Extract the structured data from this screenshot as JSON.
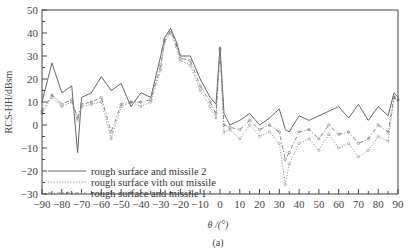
{
  "chart_data": {
    "type": "line",
    "title": "",
    "caption": "(a)",
    "xlabel": "θ /(°)",
    "ylabel": "RCS-HH/dBsm",
    "xlim": [
      -90,
      90
    ],
    "ylim": [
      -30,
      50
    ],
    "xticks": [
      -90,
      -80,
      -70,
      -60,
      -50,
      -40,
      -30,
      -20,
      -10,
      0,
      10,
      20,
      30,
      40,
      50,
      60,
      70,
      80,
      90
    ],
    "xtick_labels": [
      "−90",
      "−80",
      "−70",
      "−60",
      "−50",
      "−40",
      "−30",
      "−20",
      "−10",
      "0",
      "10",
      "20",
      "30",
      "40",
      "50",
      "60",
      "70",
      "80",
      "90"
    ],
    "yticks": [
      -30,
      -20,
      -10,
      0,
      10,
      20,
      30,
      40,
      50
    ],
    "ytick_labels": [
      "−30",
      "−20",
      "−10",
      "0",
      "10",
      "20",
      "30",
      "40",
      "50"
    ],
    "grid": false,
    "legend_position": "lower left",
    "x": [
      -90,
      -85,
      -80,
      -75,
      -72,
      -70,
      -65,
      -60,
      -55,
      -50,
      -45,
      -40,
      -35,
      -30,
      -28,
      -25,
      -22,
      -20,
      -15,
      -10,
      -5,
      -2,
      0,
      2,
      5,
      10,
      15,
      20,
      25,
      30,
      33,
      35,
      40,
      45,
      50,
      55,
      60,
      65,
      70,
      75,
      80,
      85,
      88,
      90
    ],
    "series": [
      {
        "name": "rough surface and missile 2",
        "style": "solid",
        "color": "#555555",
        "values": [
          10,
          27,
          14,
          17,
          -12,
          12,
          14,
          21,
          15,
          18,
          8,
          14,
          12,
          30,
          38,
          42,
          36,
          30,
          30,
          20,
          12,
          9,
          34,
          5,
          0,
          2,
          5,
          0,
          3,
          7,
          -2,
          -3,
          4,
          2,
          4,
          6,
          8,
          3,
          9,
          2,
          8,
          4,
          14,
          12
        ]
      },
      {
        "name": "rough surface vith out missile",
        "style": "dotted",
        "color": "#999999",
        "values": [
          5,
          12,
          8,
          10,
          2,
          8,
          9,
          10,
          -6,
          8,
          10,
          8,
          10,
          24,
          36,
          40,
          34,
          28,
          26,
          15,
          8,
          3,
          32,
          -3,
          -2,
          -6,
          0,
          -5,
          -3,
          -8,
          -26,
          -17,
          -8,
          -6,
          -11,
          -4,
          -10,
          -8,
          -14,
          -11,
          -5,
          -7,
          12,
          11
        ]
      },
      {
        "name": "rough surface and missile 1",
        "style": "dash-dot-marker",
        "color": "#777777",
        "values": [
          6,
          13,
          9,
          11,
          3,
          9,
          10,
          12,
          -3,
          9,
          10,
          10,
          11,
          26,
          37,
          41,
          35,
          29,
          28,
          17,
          10,
          5,
          33,
          0,
          -1,
          -2,
          2,
          -2,
          0,
          -3,
          -15,
          -12,
          -3,
          -2,
          -6,
          0,
          -4,
          -3,
          -8,
          -6,
          0,
          -3,
          12,
          11
        ]
      }
    ]
  },
  "legend": {
    "items": [
      {
        "label": "rough surface and missile 2",
        "style": "solid"
      },
      {
        "label": "rough surface vith out missile",
        "style": "dotted"
      },
      {
        "label": "rough surface and missile 1",
        "style": "dash-dot-marker"
      }
    ]
  }
}
